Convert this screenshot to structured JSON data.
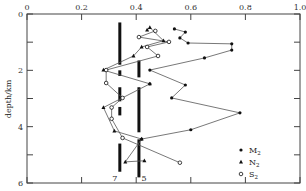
{
  "chart_data": {
    "type": "scatter",
    "title": "",
    "xlabel": "",
    "ylabel": "depth/km",
    "xlim": [
      0,
      1.0
    ],
    "ylim": [
      0,
      6
    ],
    "y_inverted": true,
    "x_axis_position": "top",
    "grid": false,
    "x_ticks": [
      0,
      0.2,
      0.4,
      0.6,
      0.8,
      1.0
    ],
    "x_tick_labels": [
      "0",
      "0.2",
      "0.4",
      "0.6",
      "0.8",
      "1.0"
    ],
    "y_ticks": [
      0,
      2,
      4,
      6
    ],
    "y_tick_labels": [
      "0",
      "2",
      "4",
      "6"
    ],
    "y_minor_ticks": [
      1,
      3,
      5
    ],
    "legend": {
      "position": "bottom-right",
      "entries": [
        {
          "label": "M",
          "subscript": "2",
          "marker": "circle-filled"
        },
        {
          "label": "N",
          "subscript": "2",
          "marker": "triangle-filled"
        },
        {
          "label": "S",
          "subscript": "2",
          "marker": "circle-open"
        }
      ]
    },
    "series": [
      {
        "name": "M2",
        "marker": "circle-filled",
        "points": [
          [
            0.54,
            0.53
          ],
          [
            0.58,
            0.64
          ],
          [
            0.56,
            0.85
          ],
          [
            0.59,
            1.03
          ],
          [
            0.75,
            1.06
          ],
          [
            0.75,
            1.28
          ],
          [
            0.65,
            1.56
          ],
          [
            0.45,
            1.99
          ],
          [
            0.58,
            2.52
          ],
          [
            0.53,
            2.98
          ],
          [
            0.78,
            3.51
          ],
          [
            0.6,
            4.11
          ],
          [
            0.42,
            4.44
          ],
          [
            0.45,
            2.48
          ]
        ],
        "line_order": [
          0,
          1,
          2,
          3,
          4,
          5,
          6,
          7,
          8,
          9,
          10,
          11,
          12
        ]
      },
      {
        "name": "N2",
        "marker": "triangle-filled",
        "points": [
          [
            0.44,
            0.57
          ],
          [
            0.45,
            0.48
          ],
          [
            0.5,
            0.95
          ],
          [
            0.42,
            1.17
          ],
          [
            0.39,
            1.49
          ],
          [
            0.28,
            1.99
          ],
          [
            0.45,
            2.48
          ],
          [
            0.28,
            3.32
          ],
          [
            0.32,
            4.15
          ],
          [
            0.42,
            4.44
          ],
          [
            0.36,
            5.25
          ],
          [
            0.43,
            5.21
          ]
        ]
      },
      {
        "name": "S2",
        "marker": "circle-open",
        "points": [
          [
            0.47,
            0.6
          ],
          [
            0.41,
            0.82
          ],
          [
            0.52,
            0.99
          ],
          [
            0.44,
            1.17
          ],
          [
            0.48,
            1.49
          ],
          [
            0.29,
            1.99
          ],
          [
            0.29,
            2.45
          ],
          [
            0.35,
            2.98
          ],
          [
            0.31,
            3.32
          ],
          [
            0.31,
            3.72
          ],
          [
            0.35,
            4.4
          ],
          [
            0.56,
            5.28
          ]
        ]
      }
    ],
    "reference_bars": [
      {
        "label": "7",
        "x": 0.34,
        "segments": [
          [
            0.3,
            1.8
          ],
          [
            2.0,
            2.2
          ],
          [
            2.6,
            3.1
          ],
          [
            3.3,
            3.6
          ],
          [
            4.6,
            5.6
          ]
        ]
      },
      {
        "label": "5",
        "x": 0.41,
        "segments": [
          [
            1.65,
            2.25
          ],
          [
            2.6,
            4.2
          ],
          [
            4.45,
            5.8
          ]
        ]
      }
    ]
  }
}
